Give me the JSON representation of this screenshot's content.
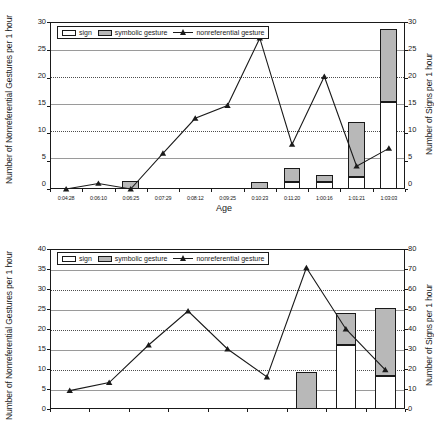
{
  "figure": {
    "series_names": {
      "sign": "sign",
      "symbolic_gesture": "symbolic gesture",
      "nonreferential_gesture": "nonreferential gesture"
    },
    "colors": {
      "sign_fill": "#ffffff",
      "symbolic_fill": "#b8b8b8",
      "line": "#1a1a1a",
      "grid": "#4d4d4d",
      "axis": "#1a1a1a"
    }
  },
  "chart_data": [
    {
      "id": "top",
      "type": "bar",
      "title": "",
      "xlabel": "Age",
      "ylabel": "Number of Nonreferential Gestures per 1 hour",
      "y2label": "Number of Signs per 1 hour",
      "ylim": [
        0,
        30
      ],
      "yticks": [
        0,
        5,
        10,
        15,
        20,
        25,
        30
      ],
      "y2lim": [
        0,
        30
      ],
      "y2ticks": [
        0,
        5,
        10,
        15,
        20,
        25,
        30
      ],
      "grid": true,
      "legend_position": "upper-left-inside",
      "categories": [
        "0:04:28",
        "0:06:10",
        "0:06:25",
        "0:07:29",
        "0:08:12",
        "0:09:25",
        "0:10:23",
        "0:11:20",
        "1:00:16",
        "1:01:21",
        "1:03:03"
      ],
      "series": [
        {
          "name": "sign",
          "axis": "right",
          "kind": "stacked-bar",
          "values": [
            0,
            0,
            0,
            0,
            0,
            0,
            0,
            1.2,
            1.3,
            2.2,
            15.7
          ]
        },
        {
          "name": "symbolic gesture",
          "axis": "right",
          "kind": "stacked-bar",
          "values": [
            0,
            0,
            1.5,
            0,
            0,
            0,
            1.2,
            2.5,
            1.2,
            9.9,
            13.0
          ]
        },
        {
          "name": "nonreferential gesture",
          "axis": "left",
          "kind": "line",
          "values": [
            0,
            1.0,
            0,
            6.4,
            12.7,
            15.0,
            27.1,
            8.0,
            20.2,
            4.1,
            7.3
          ]
        }
      ]
    },
    {
      "id": "bottom",
      "type": "bar",
      "title": "",
      "xlabel": "",
      "ylabel": "Number of Nonreferential Gestures per 1 hour",
      "y2label": "Number of Signs per 1 hour",
      "ylim": [
        0,
        40
      ],
      "yticks": [
        0,
        5,
        10,
        15,
        20,
        25,
        30,
        35,
        40
      ],
      "y2lim": [
        0,
        80
      ],
      "y2ticks": [
        0,
        10,
        20,
        30,
        40,
        50,
        60,
        70,
        80
      ],
      "grid": true,
      "legend_position": "upper-left-inside",
      "categories": [
        "",
        "",
        "",
        "",
        "",
        "",
        "",
        "",
        ""
      ],
      "series": [
        {
          "name": "sign",
          "axis": "right",
          "kind": "stacked-bar",
          "values": [
            0,
            0,
            0,
            0,
            0,
            0,
            0,
            32.0,
            16.3
          ]
        },
        {
          "name": "symbolic gesture",
          "axis": "right",
          "kind": "stacked-bar",
          "values": [
            0,
            0,
            0,
            0,
            0,
            0,
            18.5,
            16.0,
            34.3
          ]
        },
        {
          "name": "nonreferential gesture",
          "axis": "left",
          "kind": "line",
          "values": [
            4.6,
            6.6,
            16.0,
            24.5,
            15.0,
            8.0,
            35.3,
            20.0,
            9.8
          ]
        }
      ]
    }
  ]
}
